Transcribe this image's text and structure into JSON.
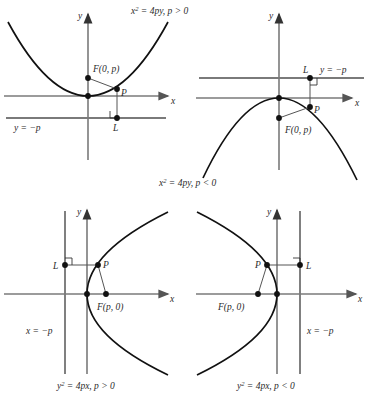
{
  "figure": {
    "colors": {
      "curve": "#111111",
      "axis": "#7a7a7a",
      "directrix": "#7a7a7a",
      "point": "#111111",
      "segment": "#555555",
      "text": "#2b2b2b",
      "background": "#ffffff"
    },
    "panels": [
      {
        "id": "top-left",
        "caption": "x2 = 4py, p > 0",
        "caption_parts": {
          "var": "x",
          "exp": "2",
          "rest": " = 4py, p > 0"
        },
        "orientation": "opens-up",
        "axis_x_label": "x",
        "axis_y_label": "y",
        "focus_label": "F(0, p)",
        "point_label": "P",
        "foot_label": "L",
        "directrix_label": "y = −p",
        "directrix_type": "horizontal",
        "right_angle": true
      },
      {
        "id": "top-right",
        "caption": "x2 = 4py, p < 0",
        "caption_parts": {
          "var": "x",
          "exp": "2",
          "rest": " = 4py, p < 0"
        },
        "orientation": "opens-down",
        "axis_x_label": "x",
        "axis_y_label": "y",
        "focus_label": "F(0, p)",
        "point_label": "P",
        "foot_label": "L",
        "directrix_label": "y = −p",
        "directrix_type": "horizontal",
        "right_angle": true
      },
      {
        "id": "bottom-left",
        "caption": "y2 = 4px, p > 0",
        "caption_parts": {
          "var": "y",
          "exp": "2",
          "rest": " = 4px, p > 0"
        },
        "orientation": "opens-right",
        "axis_x_label": "x",
        "axis_y_label": "y",
        "focus_label": "F(p, 0)",
        "point_label": "P",
        "foot_label": "L",
        "directrix_label": "x = −p",
        "directrix_type": "vertical",
        "right_angle": true
      },
      {
        "id": "bottom-right",
        "caption": "y2 = 4px, p < 0",
        "caption_parts": {
          "var": "y",
          "exp": "2",
          "rest": " = 4px, p < 0"
        },
        "orientation": "opens-left",
        "axis_x_label": "x",
        "axis_y_label": "y",
        "focus_label": "F(p, 0)",
        "point_label": "P",
        "foot_label": "L",
        "directrix_label": "x = −p",
        "directrix_type": "vertical",
        "right_angle": true
      }
    ]
  }
}
